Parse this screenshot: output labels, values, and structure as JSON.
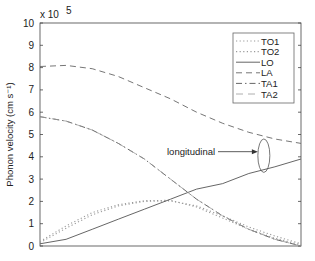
{
  "chart_data": {
    "type": "line",
    "title": "",
    "xlabel": "",
    "ylabel": "Phonon velocity (cm s⁻¹)",
    "y_multiplier_label": "x 10",
    "y_multiplier_exp": "5",
    "xlim": [
      0,
      1
    ],
    "ylim": [
      0,
      10
    ],
    "yticks": [
      0,
      1,
      2,
      3,
      4,
      5,
      6,
      7,
      8,
      9,
      10
    ],
    "ytick_labels": [
      "0",
      "1",
      "2",
      "3",
      "4",
      "5",
      "6",
      "7",
      "8",
      "9",
      "10"
    ],
    "grid": false,
    "legend_position": "top-right",
    "x": [
      0,
      0.1,
      0.2,
      0.3,
      0.4,
      0.5,
      0.6,
      0.7,
      0.8,
      0.9,
      1.0
    ],
    "series": [
      {
        "name": "TO1",
        "style": "dotted",
        "values": [
          0.2,
          0.9,
          1.5,
          1.85,
          2.03,
          2.05,
          1.75,
          1.25,
          0.75,
          0.35,
          0.05
        ]
      },
      {
        "name": "TO2",
        "style": "dotted",
        "values": [
          0.15,
          0.8,
          1.4,
          1.8,
          2.0,
          2.02,
          1.8,
          1.35,
          0.85,
          0.45,
          0.1
        ]
      },
      {
        "name": "LO",
        "style": "solid",
        "values": [
          0.1,
          0.3,
          0.75,
          1.2,
          1.65,
          2.1,
          2.55,
          2.8,
          3.25,
          3.55,
          3.9
        ]
      },
      {
        "name": "LA",
        "style": "dashed",
        "values": [
          8.05,
          8.1,
          7.95,
          7.6,
          7.1,
          6.6,
          6.0,
          5.5,
          5.1,
          4.8,
          4.6
        ]
      },
      {
        "name": "TA1",
        "style": "dashdot",
        "values": [
          5.8,
          5.6,
          5.2,
          4.6,
          3.9,
          3.0,
          2.1,
          1.35,
          0.75,
          0.3,
          0.0
        ]
      },
      {
        "name": "TA2",
        "style": "longdash",
        "values": [
          5.8,
          5.6,
          5.2,
          4.6,
          3.9,
          3.0,
          2.1,
          1.35,
          0.75,
          0.3,
          0.0
        ]
      }
    ],
    "annotations": [
      {
        "text": "longitudinal",
        "type": "arrow-to-ellipse",
        "target_x": 0.85,
        "target_y_range": [
          3.3,
          4.8
        ]
      }
    ]
  }
}
